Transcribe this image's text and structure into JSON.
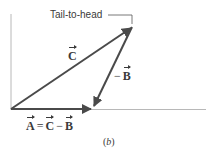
{
  "figure": {
    "annotation": "Tail-to-head",
    "caption_open": "(",
    "caption_letter": "b",
    "caption_close": ")",
    "vectors": {
      "C": {
        "symbol": "C",
        "label": "C",
        "from": [
          11,
          109
        ],
        "to": [
          132,
          27
        ]
      },
      "minusB": {
        "prefix": "−",
        "symbol": "B",
        "from": [
          132,
          27
        ],
        "to": [
          93,
          108
        ]
      },
      "A": {
        "symbol": "A",
        "from": [
          11,
          109
        ],
        "to": [
          93,
          109
        ]
      }
    },
    "equation": {
      "lhs": "A",
      "equals": "=",
      "term1": "C",
      "minus": "−",
      "term2": "B"
    },
    "colors": {
      "vector": "#4a4a4a",
      "axis": "#b8b8b8",
      "text": "#3a3a3a"
    }
  }
}
